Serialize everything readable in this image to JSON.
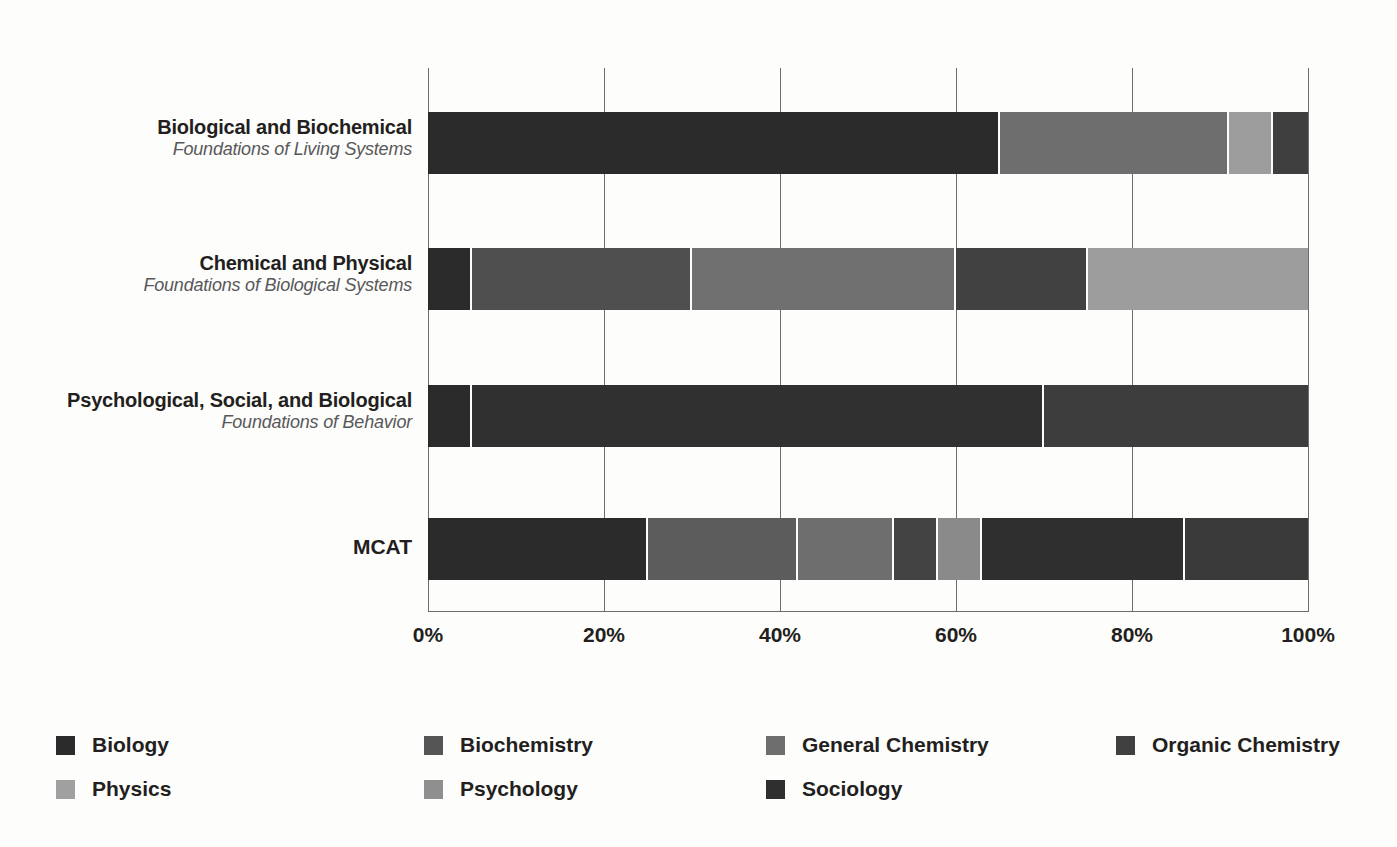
{
  "chart_data": {
    "type": "bar",
    "subtype": "stacked-bar-horizontal-100pct",
    "title": "",
    "xlabel": "",
    "ylabel": "",
    "xlim": [
      0,
      100
    ],
    "grid": true,
    "legend_position": "bottom",
    "orientation": "horizontal",
    "stacked_normalized": true,
    "tick_labels": [
      "0%",
      "20%",
      "40%",
      "60%",
      "80%",
      "100%"
    ],
    "tick_values": [
      0,
      20,
      40,
      60,
      80,
      100
    ],
    "categories": [
      {
        "main": "Biological and Biochemical",
        "sub": "Foundations of Living Systems"
      },
      {
        "main": "Chemical and Physical",
        "sub": "Foundations of Biological Systems"
      },
      {
        "main": "Psychological, Social, and Biological",
        "sub": "Foundations of Behavior"
      },
      {
        "main": "MCAT",
        "sub": ""
      }
    ],
    "series": [
      {
        "name": "Biology",
        "color": "#2b2b2b",
        "values": [
          65,
          5,
          5,
          25
        ]
      },
      {
        "name": "Biochemistry",
        "color": "#4a4a4a",
        "values": [
          0,
          15,
          0,
          17
        ]
      },
      {
        "name": "General Chemistry",
        "color": "#6e6e6e",
        "values": [
          26,
          30,
          0,
          11
        ]
      },
      {
        "name": "Organic Chemistry",
        "color": "#3f3f3f",
        "values": [
          4,
          25,
          0,
          5
        ]
      },
      {
        "name": "Physics",
        "color": "#9d9d9d",
        "values": [
          5,
          25,
          0,
          14
        ]
      },
      {
        "name": "Psychology",
        "color": "#8a8a8a",
        "values": [
          0,
          0,
          30,
          5
        ]
      },
      {
        "name": "Sociology",
        "color": "#333333",
        "values": [
          0,
          0,
          60,
          23
        ]
      }
    ],
    "bars": [
      {
        "category": "Biological and Biochemical",
        "segments": [
          {
            "name": "Biology",
            "value": 65,
            "start": 0,
            "color": "#2b2b2b"
          },
          {
            "name": "General Chemistry",
            "value": 26,
            "start": 65,
            "color": "#6e6e6e"
          },
          {
            "name": "Physics",
            "value": 5,
            "start": 91,
            "color": "#9d9d9d"
          },
          {
            "name": "Organic Chemistry",
            "value": 4,
            "start": 96,
            "color": "#3f3f3f"
          }
        ]
      },
      {
        "category": "Chemical and Physical",
        "segments": [
          {
            "name": "Biology",
            "value": 5,
            "start": 0,
            "color": "#2b2b2b"
          },
          {
            "name": "Organic Chemistry",
            "value": 25,
            "start": 5,
            "color": "#4f4f4f"
          },
          {
            "name": "General Chemistry",
            "value": 30,
            "start": 30,
            "color": "#707070"
          },
          {
            "name": "Biochemistry",
            "value": 15,
            "start": 60,
            "color": "#414141"
          },
          {
            "name": "Physics",
            "value": 25,
            "start": 75,
            "color": "#9d9d9d"
          }
        ]
      },
      {
        "category": "Psychological, Social, and Biological",
        "segments": [
          {
            "name": "Biology",
            "value": 5,
            "start": 0,
            "color": "#2b2b2b"
          },
          {
            "name": "Sociology",
            "value": 65,
            "start": 5,
            "color": "#303030"
          },
          {
            "name": "Psychology",
            "value": 30,
            "start": 70,
            "color": "#3d3d3d"
          }
        ]
      },
      {
        "category": "MCAT",
        "segments": [
          {
            "name": "Biology",
            "value": 25,
            "start": 0,
            "color": "#2b2b2b"
          },
          {
            "name": "Biochemistry",
            "value": 17,
            "start": 25,
            "color": "#5c5c5c"
          },
          {
            "name": "General Chemistry",
            "value": 11,
            "start": 42,
            "color": "#6e6e6e"
          },
          {
            "name": "Organic Chemistry",
            "value": 5,
            "start": 53,
            "color": "#434343"
          },
          {
            "name": "Psychology",
            "value": 5,
            "start": 58,
            "color": "#8a8a8a"
          },
          {
            "name": "Sociology",
            "value": 23,
            "start": 63,
            "color": "#2f2f2f"
          },
          {
            "name": "Physics",
            "value": 14,
            "start": 86,
            "color": "#3a3a3a"
          }
        ]
      }
    ]
  },
  "legend": {
    "items": [
      {
        "label": "Biology",
        "color": "#2b2b2b"
      },
      {
        "label": "Biochemistry",
        "color": "#555555"
      },
      {
        "label": "General Chemistry",
        "color": "#6e6e6e"
      },
      {
        "label": "Organic Chemistry",
        "color": "#404040"
      },
      {
        "label": "Physics",
        "color": "#a0a0a0"
      },
      {
        "label": "Psychology",
        "color": "#8f8f8f"
      },
      {
        "label": "Sociology",
        "color": "#2f2f2f"
      }
    ]
  }
}
